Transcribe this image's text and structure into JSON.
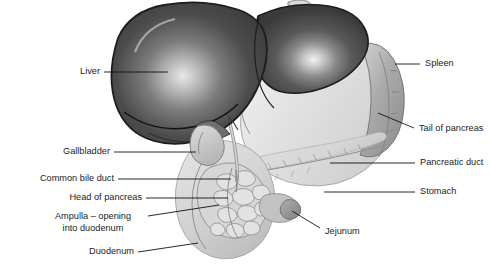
{
  "figure": {
    "background_color": "#ffffff",
    "text_color": "#1b1b1b",
    "leader_color": "#111111",
    "width": 491,
    "height": 265
  },
  "labels": [
    {
      "id": "liver",
      "text": "Liver",
      "side": "left",
      "lines": [
        "Liver"
      ]
    },
    {
      "id": "gallbladder",
      "text": "Gallbladder",
      "side": "left",
      "lines": [
        "Gallbladder"
      ]
    },
    {
      "id": "common-bile-duct",
      "text": "Common bile duct",
      "side": "left",
      "lines": [
        "Common bile duct"
      ]
    },
    {
      "id": "head-of-pancreas",
      "text": "Head of pancreas",
      "side": "left",
      "lines": [
        "Head of pancreas"
      ]
    },
    {
      "id": "ampulla",
      "text": "Ampulla – opening into duodenum",
      "side": "left",
      "lines": [
        "Ampulla – opening",
        "into duodenum"
      ]
    },
    {
      "id": "duodenum",
      "text": "Duodenum",
      "side": "left",
      "lines": [
        "Duodenum"
      ]
    },
    {
      "id": "spleen",
      "text": "Spleen",
      "side": "right",
      "lines": [
        "Spleen"
      ]
    },
    {
      "id": "tail-of-pancreas",
      "text": "Tail of pancreas",
      "side": "right",
      "lines": [
        "Tail of pancreas"
      ]
    },
    {
      "id": "pancreatic-duct",
      "text": "Pancreatic duct",
      "side": "right",
      "lines": [
        "Pancreatic duct"
      ]
    },
    {
      "id": "stomach",
      "text": "Stomach",
      "side": "right",
      "lines": [
        "Stomach"
      ]
    },
    {
      "id": "jejunum",
      "text": "Jejunum",
      "side": "right",
      "lines": [
        "Jejunum"
      ]
    }
  ],
  "organs": {
    "liver": {
      "name": "Liver",
      "tone": "dark-grey",
      "color": "#4a4a4a"
    },
    "gallbladder": {
      "name": "Gallbladder",
      "tone": "light-grey",
      "color": "#c9c9c9"
    },
    "stomach": {
      "name": "Stomach",
      "tone": "pale-grey",
      "color": "#dcdcdc"
    },
    "spleen": {
      "name": "Spleen",
      "tone": "mid-grey",
      "color": "#a8a8a8"
    },
    "pancreas_head": {
      "name": "Head of pancreas",
      "tone": "lobulated",
      "color": "#d2d2d2"
    },
    "pancreas_body": {
      "name": "Body and tail of pancreas",
      "tone": "pale-grey",
      "color": "#d8d8d8"
    },
    "duodenum": {
      "name": "Duodenum",
      "tone": "pale-grey",
      "color": "#cdcdcd"
    },
    "jejunum": {
      "name": "Jejunum",
      "tone": "mid-grey",
      "color": "#9a9a9a"
    },
    "common_bile_duct": {
      "name": "Common bile duct",
      "tone": "mid-grey",
      "color": "#b4b4b4"
    },
    "pancreatic_duct": {
      "name": "Pancreatic duct",
      "tone": "line",
      "color": "#9d9d9d"
    },
    "esophagus": {
      "name": "Esophagus",
      "tone": "light-grey",
      "color": "#c4c4c4"
    }
  }
}
